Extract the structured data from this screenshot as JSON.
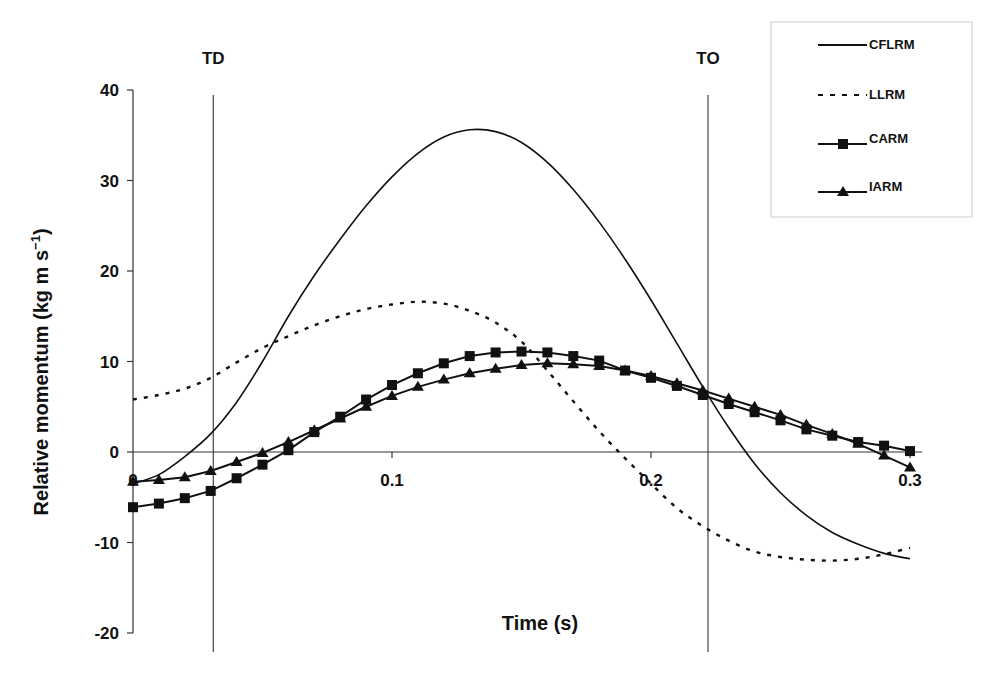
{
  "chart_data": {
    "type": "line",
    "title": "",
    "xlabel": "Time (s)",
    "ylabel": "Relative momentum (kg m s⁻¹)",
    "ylabel_main": "Relative momentum (kg m s",
    "ylabel_sup": "−1",
    "ylabel_close": ")",
    "xlim": [
      0,
      0.3
    ],
    "ylim": [
      -20,
      40
    ],
    "x_ticks": [
      0,
      0.1,
      0.2,
      0.3
    ],
    "x_tick_labels": [
      "0",
      "0.1",
      "0.2",
      "0.3"
    ],
    "y_ticks": [
      40,
      30,
      20,
      10,
      0,
      -10,
      -20
    ],
    "y_tick_labels": [
      "40",
      "30",
      "20",
      "10",
      "0",
      "-10",
      "-20"
    ],
    "grid": false,
    "legend_position": "top-right",
    "events": [
      {
        "label": "TD",
        "x": 0.031
      },
      {
        "label": "TO",
        "x": 0.222
      }
    ],
    "x": [
      0,
      0.01,
      0.02,
      0.03,
      0.04,
      0.05,
      0.06,
      0.07,
      0.08,
      0.09,
      0.1,
      0.11,
      0.12,
      0.13,
      0.14,
      0.15,
      0.16,
      0.17,
      0.18,
      0.19,
      0.2,
      0.21,
      0.22,
      0.23,
      0.24,
      0.25,
      0.26,
      0.27,
      0.28,
      0.29,
      0.3
    ],
    "series": [
      {
        "name": "CFLRM",
        "style": "solid",
        "marker": "none",
        "values": [
          -3.5,
          -2.5,
          -0.5,
          2.0,
          5.5,
          10.0,
          15.0,
          19.5,
          23.5,
          27.2,
          30.4,
          33.0,
          34.8,
          35.6,
          35.4,
          34.2,
          32.0,
          29.0,
          25.4,
          21.3,
          16.8,
          12.0,
          7.2,
          2.7,
          -1.3,
          -4.5,
          -7.0,
          -8.9,
          -10.2,
          -11.2,
          -11.8
        ]
      },
      {
        "name": "LLRM",
        "style": "dashed",
        "marker": "none",
        "values": [
          5.8,
          6.3,
          7.0,
          8.2,
          9.9,
          11.5,
          12.8,
          14.0,
          15.0,
          15.8,
          16.3,
          16.6,
          16.4,
          15.6,
          14.3,
          12.2,
          9.0,
          5.6,
          2.3,
          -0.7,
          -3.5,
          -6.2,
          -8.2,
          -9.8,
          -11.0,
          -11.6,
          -11.9,
          -12.0,
          -11.8,
          -11.3,
          -10.6
        ]
      },
      {
        "name": "CARM",
        "style": "solid",
        "marker": "square",
        "values": [
          -6.1,
          -5.7,
          -5.1,
          -4.3,
          -2.9,
          -1.4,
          0.2,
          2.2,
          3.9,
          5.8,
          7.4,
          8.7,
          9.8,
          10.6,
          11.0,
          11.1,
          11.0,
          10.6,
          10.1,
          9.0,
          8.2,
          7.3,
          6.3,
          5.3,
          4.4,
          3.5,
          2.5,
          1.8,
          1.1,
          0.7,
          0.1
        ]
      },
      {
        "name": "IARM",
        "style": "solid",
        "marker": "triangle",
        "values": [
          -3.3,
          -3.1,
          -2.8,
          -2.1,
          -1.1,
          -0.1,
          1.1,
          2.4,
          3.7,
          5.0,
          6.2,
          7.2,
          8.0,
          8.7,
          9.2,
          9.6,
          9.8,
          9.7,
          9.5,
          9.0,
          8.4,
          7.6,
          6.8,
          5.9,
          5.0,
          4.1,
          3.0,
          2.0,
          0.9,
          -0.4,
          -1.7
        ]
      }
    ]
  },
  "colors": {
    "line": "#111111",
    "axis": "#333333",
    "legend_border": "#cccccc",
    "background": "#ffffff"
  }
}
